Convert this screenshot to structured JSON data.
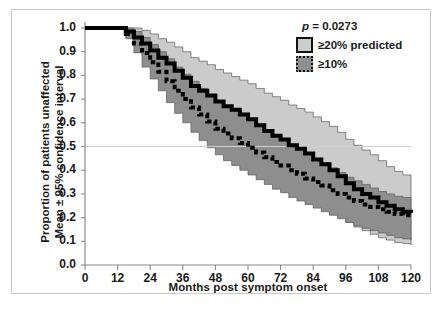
{
  "chart_data": {
    "type": "line",
    "title": "",
    "xlabel": "Months post symptom onset",
    "ylabel_line1": "Proportion of patients unaffected",
    "ylabel_line2": "Mean ± 95% confidence interval",
    "xlim": [
      0,
      120
    ],
    "ylim": [
      0.0,
      1.0
    ],
    "xticks": [
      0,
      12,
      24,
      36,
      48,
      60,
      72,
      84,
      96,
      108,
      120
    ],
    "xtick_labels": [
      "0",
      "12",
      "24",
      "36",
      "48",
      "60",
      "72",
      "84",
      "96",
      "108",
      "120"
    ],
    "yticks": [
      0.0,
      0.1,
      0.2,
      0.3,
      0.4,
      0.5,
      0.6,
      0.7,
      0.8,
      0.9,
      1.0
    ],
    "ytick_labels": [
      "0.0",
      "0.1",
      "0.2",
      "0.3",
      "0.4",
      "0.5",
      "0.6",
      "0.7",
      "0.8",
      "0.9",
      "1.0"
    ],
    "grid": "horizontal reference line at y=0.5 only",
    "legend_position": "top-right inside axes",
    "annotations": [
      {
        "name": "p-value",
        "text": "p = 0.0273",
        "x": 96,
        "y": 0.96
      }
    ],
    "reference_line": {
      "axis": "y",
      "value": 0.5,
      "color": "#d0d0d0"
    },
    "series": [
      {
        "name": "≥20% predicted",
        "style": "solid-thick-black",
        "band_color": "#cbcbcb",
        "x": [
          0,
          6,
          12,
          15,
          18,
          21,
          24,
          27,
          30,
          33,
          36,
          39,
          42,
          45,
          48,
          51,
          54,
          57,
          60,
          63,
          66,
          69,
          72,
          75,
          78,
          81,
          84,
          87,
          90,
          93,
          96,
          99,
          102,
          105,
          108,
          111,
          114,
          117,
          120
        ],
        "values": [
          1.0,
          1.0,
          1.0,
          0.985,
          0.96,
          0.935,
          0.905,
          0.875,
          0.85,
          0.82,
          0.79,
          0.755,
          0.735,
          0.715,
          0.69,
          0.67,
          0.655,
          0.635,
          0.615,
          0.59,
          0.565,
          0.545,
          0.53,
          0.505,
          0.49,
          0.47,
          0.445,
          0.425,
          0.4,
          0.375,
          0.345,
          0.32,
          0.3,
          0.285,
          0.265,
          0.25,
          0.235,
          0.225,
          0.22
        ],
        "ci_upper": [
          1.0,
          1.0,
          1.0,
          1.0,
          1.0,
          0.99,
          0.975,
          0.955,
          0.94,
          0.92,
          0.9,
          0.875,
          0.86,
          0.845,
          0.825,
          0.81,
          0.795,
          0.78,
          0.765,
          0.745,
          0.725,
          0.71,
          0.695,
          0.675,
          0.66,
          0.645,
          0.625,
          0.605,
          0.585,
          0.56,
          0.53,
          0.505,
          0.485,
          0.465,
          0.44,
          0.415,
          0.395,
          0.38,
          0.37
        ],
        "ci_lower": [
          1.0,
          1.0,
          1.0,
          0.965,
          0.925,
          0.885,
          0.84,
          0.8,
          0.765,
          0.725,
          0.685,
          0.645,
          0.615,
          0.59,
          0.56,
          0.535,
          0.515,
          0.49,
          0.47,
          0.44,
          0.415,
          0.39,
          0.37,
          0.345,
          0.325,
          0.3,
          0.275,
          0.255,
          0.23,
          0.205,
          0.18,
          0.16,
          0.145,
          0.13,
          0.115,
          0.105,
          0.095,
          0.09,
          0.085
        ]
      },
      {
        "name": "≥10%",
        "style": "dotted-thick-black",
        "band_color": "#8e8e8e",
        "x": [
          0,
          6,
          12,
          15,
          18,
          21,
          24,
          27,
          30,
          33,
          36,
          39,
          42,
          45,
          48,
          51,
          54,
          57,
          60,
          63,
          66,
          69,
          72,
          75,
          78,
          81,
          84,
          87,
          90,
          93,
          96,
          99,
          102,
          105,
          108,
          111,
          114,
          117,
          120
        ],
        "values": [
          1.0,
          1.0,
          1.0,
          0.975,
          0.935,
          0.895,
          0.855,
          0.815,
          0.775,
          0.735,
          0.7,
          0.665,
          0.635,
          0.605,
          0.575,
          0.555,
          0.535,
          0.515,
          0.495,
          0.475,
          0.455,
          0.435,
          0.42,
          0.4,
          0.385,
          0.365,
          0.35,
          0.335,
          0.315,
          0.3,
          0.285,
          0.27,
          0.255,
          0.245,
          0.235,
          0.225,
          0.215,
          0.21,
          0.205
        ],
        "ci_upper": [
          1.0,
          1.0,
          1.0,
          1.0,
          0.985,
          0.96,
          0.93,
          0.9,
          0.87,
          0.835,
          0.805,
          0.775,
          0.745,
          0.715,
          0.69,
          0.67,
          0.65,
          0.63,
          0.61,
          0.59,
          0.57,
          0.55,
          0.53,
          0.51,
          0.49,
          0.47,
          0.45,
          0.43,
          0.41,
          0.39,
          0.37,
          0.355,
          0.34,
          0.325,
          0.31,
          0.3,
          0.29,
          0.285,
          0.28
        ],
        "ci_lower": [
          1.0,
          1.0,
          1.0,
          0.955,
          0.895,
          0.835,
          0.785,
          0.735,
          0.685,
          0.64,
          0.6,
          0.56,
          0.525,
          0.495,
          0.465,
          0.44,
          0.42,
          0.4,
          0.38,
          0.36,
          0.34,
          0.32,
          0.305,
          0.285,
          0.27,
          0.255,
          0.24,
          0.225,
          0.21,
          0.195,
          0.18,
          0.165,
          0.155,
          0.145,
          0.135,
          0.125,
          0.115,
          0.11,
          0.105
        ]
      }
    ]
  },
  "legend": {
    "pvalue_italic": "p",
    "pvalue_text": " = 0.0273",
    "items": [
      {
        "label": "≥20% predicted",
        "swatch": "solid"
      },
      {
        "label": "≥10%",
        "swatch": "dotted"
      }
    ]
  },
  "axes": {
    "x_title": "Months post symptom onset",
    "y_title_line1": "Proportion of patients unaffected",
    "y_title_line2": "Mean ± 95% confidence interval"
  },
  "colors": {
    "band_light": "#cbcbcb",
    "band_dark": "#8e8e8e",
    "line": "#000000",
    "reference_line": "#d0d0d0",
    "frame": "#c9c9c9",
    "text": "#1a1a1a"
  }
}
